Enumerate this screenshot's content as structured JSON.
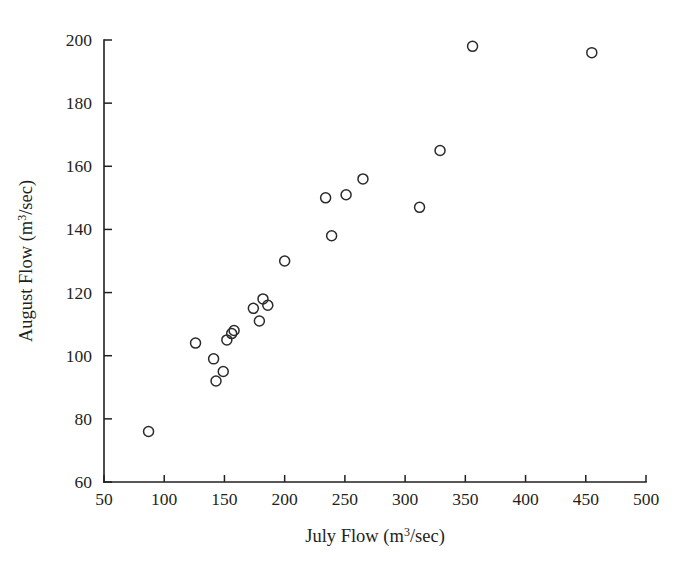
{
  "chart_data": {
    "type": "scatter",
    "title": "",
    "xlabel": "July Flow (m3/sec)",
    "xlabel_parts": {
      "pre": "July Flow (m",
      "sup": "3",
      "post": "/sec)"
    },
    "ylabel": "August Flow (m3/sec)",
    "ylabel_parts": {
      "pre": "August Flow (m",
      "sup": "3",
      "post": "/sec)"
    },
    "xlim": [
      50,
      500
    ],
    "ylim": [
      60,
      200
    ],
    "xticks": [
      50,
      100,
      150,
      200,
      250,
      300,
      350,
      400,
      450,
      500
    ],
    "yticks": [
      60,
      80,
      100,
      120,
      140,
      160,
      180,
      200
    ],
    "xtick_labels": [
      "50",
      "100",
      "150",
      "200",
      "250",
      "300",
      "350",
      "400",
      "450",
      "500"
    ],
    "ytick_labels": [
      "60",
      "80",
      "100",
      "120",
      "140",
      "160",
      "180",
      "200"
    ],
    "grid": false,
    "legend": null,
    "marker": "open-circle",
    "marker_color": "#2a2a2a",
    "series": [
      {
        "name": "July vs August Flow",
        "points": [
          {
            "x": 87,
            "y": 76
          },
          {
            "x": 126,
            "y": 104
          },
          {
            "x": 141,
            "y": 99
          },
          {
            "x": 143,
            "y": 92
          },
          {
            "x": 149,
            "y": 95
          },
          {
            "x": 152,
            "y": 105
          },
          {
            "x": 156,
            "y": 107
          },
          {
            "x": 158,
            "y": 108
          },
          {
            "x": 174,
            "y": 115
          },
          {
            "x": 179,
            "y": 111
          },
          {
            "x": 182,
            "y": 118
          },
          {
            "x": 186,
            "y": 116
          },
          {
            "x": 200,
            "y": 130
          },
          {
            "x": 234,
            "y": 150
          },
          {
            "x": 239,
            "y": 138
          },
          {
            "x": 251,
            "y": 151
          },
          {
            "x": 265,
            "y": 156
          },
          {
            "x": 312,
            "y": 147
          },
          {
            "x": 329,
            "y": 165
          },
          {
            "x": 356,
            "y": 198
          },
          {
            "x": 455,
            "y": 196
          }
        ]
      }
    ]
  },
  "figure": {
    "background_color": "#ffffff",
    "axis_color": "#231f20"
  }
}
